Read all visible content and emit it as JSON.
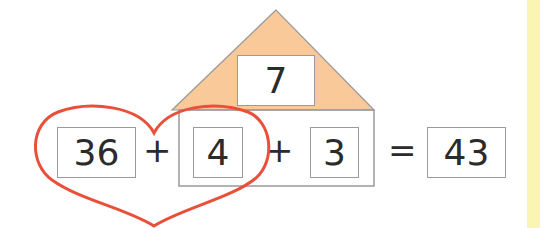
{
  "diagram": {
    "roof_value": "7",
    "equation": {
      "term1": "36",
      "op1": "+",
      "term2": "4",
      "op2": "+",
      "term3": "3",
      "equals": "=",
      "result": "43"
    },
    "colors": {
      "roof_fill": "#f9c99a",
      "heart_stroke": "#e8503a",
      "box_border": "#9a9a9a",
      "side_strip": "#fbf5b4"
    },
    "shapes": [
      "house-roof-triangle",
      "house-body-rectangle",
      "heart-outline"
    ]
  }
}
